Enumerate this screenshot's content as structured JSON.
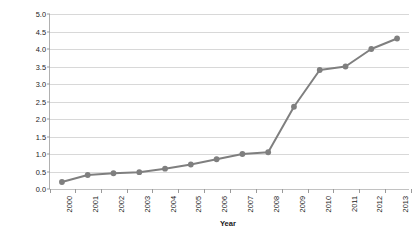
{
  "chart_data": {
    "type": "line",
    "title": "",
    "xlabel": "Year",
    "ylabel": "Structured observations (Billions)",
    "categories": [
      "2000",
      "2001",
      "2002",
      "2003",
      "2004",
      "2005",
      "2006",
      "2007",
      "2008",
      "2009",
      "2010",
      "2011",
      "2012",
      "2013"
    ],
    "values": [
      0.2,
      0.4,
      0.45,
      0.48,
      0.58,
      0.7,
      0.85,
      1.0,
      1.05,
      2.35,
      3.4,
      3.5,
      4.0,
      4.3
    ],
    "series": [
      {
        "name": "Structured observations",
        "values": [
          0.2,
          0.4,
          0.45,
          0.48,
          0.58,
          0.7,
          0.85,
          1.0,
          1.05,
          2.35,
          3.4,
          3.5,
          4.0,
          4.3
        ]
      }
    ],
    "ylim": [
      0.0,
      5.0
    ],
    "ytick_labels": [
      "0.0",
      "0.5",
      "1.0",
      "1.5",
      "2.0",
      "2.5",
      "3.0",
      "3.5",
      "4.0",
      "4.5",
      "5.0"
    ],
    "ytick_values": [
      0.0,
      0.5,
      1.0,
      1.5,
      2.0,
      2.5,
      3.0,
      3.5,
      4.0,
      4.5,
      5.0
    ],
    "grid": "horizontal",
    "legend": "none",
    "line_color": "#7f7f7f",
    "marker_color": "#7f7f7f",
    "marker_shape": "circle",
    "gridline_color": "#d8d8d8",
    "axis_color": "#b0b0b0",
    "background_color": "#ffffff",
    "text_color": "#1a1a1a"
  }
}
